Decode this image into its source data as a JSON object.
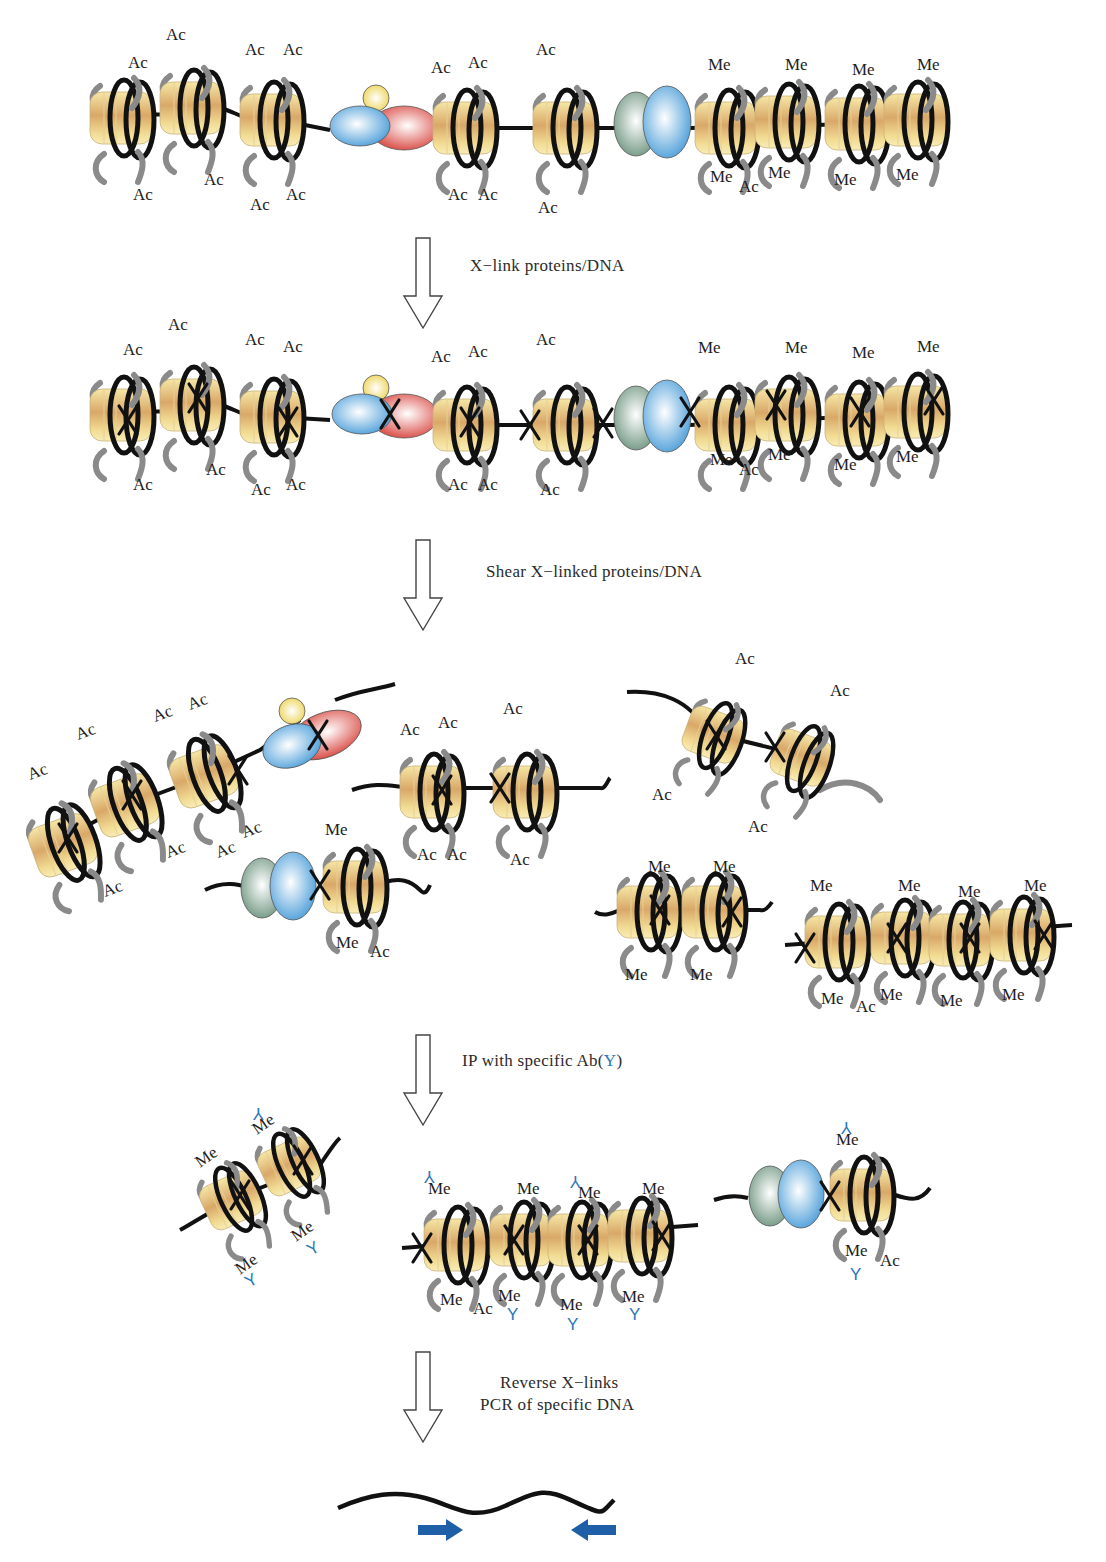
{
  "colors": {
    "dna": "#111111",
    "histone_tail": "#8a8a8a",
    "core_light": "#f6e7a6",
    "core_dark": "#d8a866",
    "protein_blue": "#6fb4e6",
    "protein_red": "#e0605a",
    "protein_yellow": "#f3e07a",
    "protein_green": "#8fae98",
    "antibody": "#2a78b8",
    "primer": "#1f5fa8",
    "arrow_outline": "#444444"
  },
  "labels": {
    "acetyl": "Ac",
    "methyl": "Me",
    "antibody_glyph": "Y"
  },
  "steps": [
    {
      "id": "crosslink",
      "label": "X−link proteins/DNA",
      "arrow_y": 238,
      "label_x": 470,
      "label_y": 258
    },
    {
      "id": "shear",
      "label": "Shear X−linked proteins/DNA",
      "arrow_y": 540,
      "label_x": 486,
      "label_y": 563
    },
    {
      "id": "ip",
      "label_prefix": "IP with specific Ab(",
      "label_ab": "Y",
      "label_suffix": ")",
      "arrow_y": 1035,
      "label_x": 462,
      "label_y": 1052
    },
    {
      "id": "reverse",
      "label_line1": "Reverse X−links",
      "label_line2": "PCR of specific DNA",
      "arrow_y": 1352,
      "label_x": 480,
      "label_y": 1372
    }
  ],
  "stages": [
    {
      "name": "native-chromatin",
      "nucleosomes": [
        {
          "x": 122,
          "y": 118,
          "mods": [
            [
              "Ac",
              140,
              68
            ],
            [
              "Ac",
              145,
              200
            ]
          ]
        },
        {
          "x": 192,
          "y": 108,
          "mods": [
            [
              "Ac",
              178,
              40
            ],
            [
              "Ac",
              216,
              185
            ]
          ]
        },
        {
          "x": 272,
          "y": 120,
          "mods": [
            [
              "Ac",
              257,
              55
            ],
            [
              "Ac",
              295,
              55
            ],
            [
              "Ac",
              262,
              210
            ],
            [
              "Ac",
              298,
              200
            ]
          ]
        },
        {
          "x": 465,
          "y": 128,
          "mods": [
            [
              "Ac",
              443,
              73
            ],
            [
              "Ac",
              480,
              68
            ],
            [
              "Ac",
              460,
              200
            ],
            [
              "Ac",
              490,
              200
            ]
          ]
        },
        {
          "x": 565,
          "y": 128,
          "mods": [
            [
              "Ac",
              548,
              55
            ],
            [
              "Ac",
              550,
              213
            ]
          ]
        },
        {
          "x": 727,
          "y": 128,
          "mods": [
            [
              "Me",
              720,
              70
            ],
            [
              "Me",
              722,
              182
            ],
            [
              "Ac",
              751,
              192
            ]
          ]
        },
        {
          "x": 787,
          "y": 122,
          "mods": [
            [
              "Me",
              797,
              70
            ],
            [
              "Me",
              780,
              178
            ]
          ]
        },
        {
          "x": 857,
          "y": 124,
          "mods": [
            [
              "Me",
              864,
              75
            ],
            [
              "Me",
              846,
              185
            ]
          ]
        },
        {
          "x": 916,
          "y": 120,
          "mods": [
            [
              "Me",
              929,
              70
            ],
            [
              "Me",
              908,
              180
            ]
          ]
        }
      ],
      "complexes": [
        {
          "type": "tri",
          "x": 395,
          "y": 125
        },
        {
          "type": "duo",
          "x": 652,
          "y": 122
        }
      ]
    },
    {
      "name": "crosslinked-chromatin",
      "nucleosomes": [
        {
          "x": 122,
          "y": 415,
          "mods": [
            [
              "Ac",
              135,
              355
            ],
            [
              "Ac",
              145,
              490
            ]
          ],
          "x_mark": true
        },
        {
          "x": 192,
          "y": 405,
          "mods": [
            [
              "Ac",
              180,
              330
            ],
            [
              "Ac",
              218,
              475
            ]
          ],
          "x_mark": true
        },
        {
          "x": 272,
          "y": 417,
          "mods": [
            [
              "Ac",
              257,
              345
            ],
            [
              "Ac",
              295,
              352
            ],
            [
              "Ac",
              263,
              495
            ],
            [
              "Ac",
              298,
              490
            ]
          ],
          "x_mark": true
        },
        {
          "x": 465,
          "y": 425,
          "mods": [
            [
              "Ac",
              443,
              362
            ],
            [
              "Ac",
              480,
              357
            ],
            [
              "Ac",
              460,
              490
            ],
            [
              "Ac",
              490,
              490
            ]
          ],
          "x_mark": true
        },
        {
          "x": 565,
          "y": 425,
          "mods": [
            [
              "Ac",
              548,
              345
            ],
            [
              "Ac",
              552,
              495
            ]
          ],
          "x_mark": true
        },
        {
          "x": 727,
          "y": 425,
          "mods": [
            [
              "Me",
              710,
              353
            ],
            [
              "Me",
              722,
              465
            ],
            [
              "Ac",
              751,
              475
            ]
          ],
          "x_mark": false
        },
        {
          "x": 787,
          "y": 415,
          "mods": [
            [
              "Me",
              797,
              353
            ],
            [
              "Me",
              780,
              460
            ]
          ],
          "x_mark": true
        },
        {
          "x": 857,
          "y": 420,
          "mods": [
            [
              "Me",
              864,
              358
            ],
            [
              "Me",
              846,
              470
            ]
          ],
          "x_mark": true
        },
        {
          "x": 916,
          "y": 412,
          "mods": [
            [
              "Me",
              929,
              352
            ],
            [
              "Me",
              908,
              462
            ]
          ],
          "x_mark": true
        }
      ],
      "complexes": [
        {
          "type": "tri",
          "x": 395,
          "y": 415,
          "x_mark": true
        },
        {
          "type": "duo",
          "x": 652,
          "y": 418,
          "x_mark": true
        }
      ]
    }
  ],
  "fragments": {
    "sheared": [
      {
        "name": "fragment-acetyl-complex",
        "items": [
          "4 nucleosomes (Ac)",
          "tri-protein complex"
        ]
      },
      {
        "name": "fragment-acetyl-pair",
        "items": [
          "2 nucleosomes (Ac)"
        ]
      },
      {
        "name": "fragment-acetyl-tilted",
        "items": [
          "2 nucleosomes (Ac)"
        ]
      },
      {
        "name": "fragment-methyl-complex",
        "items": [
          "duo-protein complex",
          "1 nucleosome (Me, Ac)"
        ]
      },
      {
        "name": "fragment-methyl-pair",
        "items": [
          "2 nucleosomes (Me)"
        ]
      },
      {
        "name": "fragment-methyl-quad",
        "items": [
          "4 nucleosomes (Me, Ac)"
        ]
      }
    ],
    "immunoprecipitated": [
      {
        "name": "ip-methyl-pair"
      },
      {
        "name": "ip-methyl-quad"
      },
      {
        "name": "ip-methyl-complex"
      }
    ]
  },
  "pcr": {
    "dna_label": "specific DNA",
    "primers": [
      "forward-primer",
      "reverse-primer"
    ]
  }
}
